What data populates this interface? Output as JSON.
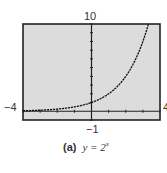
{
  "chart_data": {
    "type": "line",
    "title": "",
    "caption_tag": "(a)",
    "caption_eq": "y = 2",
    "caption_exp": "x",
    "function": "y = 2^x",
    "xlabel": "",
    "ylabel": "",
    "xlim": [
      -4,
      4
    ],
    "ylim": [
      -1,
      10
    ],
    "window_labels": {
      "xmin": "−4",
      "xmax": "4",
      "ymin": "−1",
      "ymax": "10"
    },
    "grid": false,
    "x_ticks_step": 1,
    "y_ticks_step": 1,
    "series": [
      {
        "name": "y = 2^x",
        "x": [
          -4,
          -3,
          -2,
          -1,
          0,
          1,
          2,
          3,
          3.32
        ],
        "y": [
          0.0625,
          0.125,
          0.25,
          0.5,
          1,
          2,
          4,
          8,
          10
        ]
      }
    ],
    "colors": {
      "plot_bg": "#dcdcdc",
      "frame": "#222222",
      "curve": "#111111",
      "axis": "#222222"
    }
  }
}
